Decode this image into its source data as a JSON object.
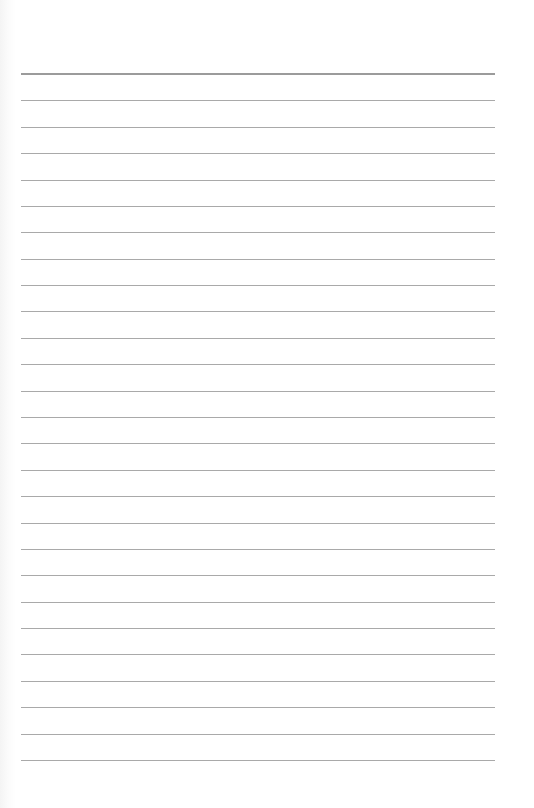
{
  "page": {
    "type": "blank lined paper",
    "background_color": "#ffffff",
    "rule_color": "#a9a9a9",
    "heavy_rule_color": "#9b9b9b",
    "rules": {
      "count": 27,
      "first_y": 74,
      "last_y": 760,
      "left_x": 21,
      "right_x": 495,
      "first_is_heavy": true
    },
    "text_content": []
  }
}
